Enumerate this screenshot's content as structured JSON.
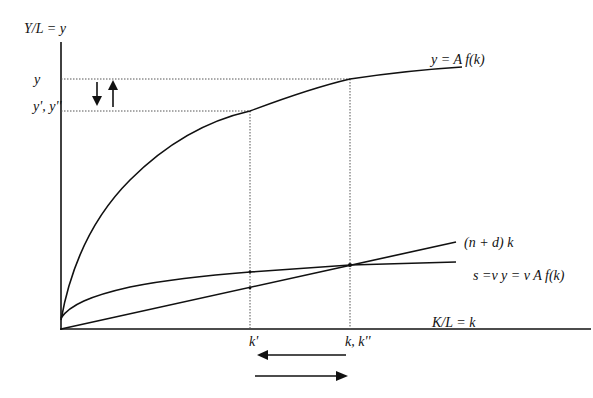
{
  "diagram": {
    "type": "Solow growth model diagram",
    "axes": {
      "y_label": "Y/L = y",
      "x_label": "K/L = k"
    },
    "curves": {
      "production": {
        "label": "y = A f(k)"
      },
      "depreciation": {
        "label": "(n + d) k"
      },
      "saving": {
        "label": "s =v y = v A f(k)"
      }
    },
    "y_ticks": {
      "y_high": "y",
      "y_low": "y', y''"
    },
    "x_ticks": {
      "k_low": "k'",
      "k_high": "k, k''"
    },
    "arrows": {
      "vertical_down": "down-arrow",
      "vertical_up": "up-arrow",
      "horizontal_left": "left-arrow",
      "horizontal_right": "right-arrow"
    },
    "colors": {
      "line": "#111111",
      "dotted": "#555555",
      "background": "#ffffff"
    }
  }
}
